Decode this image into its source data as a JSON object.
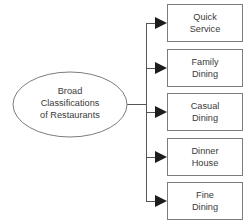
{
  "diagram": {
    "type": "hierarchy-tree",
    "title": "Broad Classifications of Restaurants",
    "orientation": "left-to-right",
    "colors": {
      "background": "#ffffff",
      "shape_fill": "#ffffff",
      "shape_stroke": "#7c7c7c",
      "connector_stroke": "#555555",
      "arrowhead_fill": "#1d1d1d",
      "text": "#3a3a3a"
    },
    "root": {
      "shape": "ellipse",
      "line1": "Broad",
      "line2": "Classifications",
      "line3": "of Restaurants"
    },
    "children": [
      {
        "shape": "rectangle",
        "line1": "Quick",
        "line2": "Service"
      },
      {
        "shape": "rectangle",
        "line1": "Family",
        "line2": "Dining"
      },
      {
        "shape": "rectangle",
        "line1": "Casual",
        "line2": "Dining"
      },
      {
        "shape": "rectangle",
        "line1": "Dinner",
        "line2": "House"
      },
      {
        "shape": "rectangle",
        "line1": "Fine",
        "line2": "Dining"
      }
    ]
  }
}
